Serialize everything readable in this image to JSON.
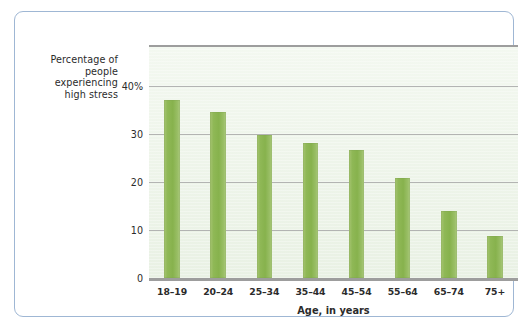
{
  "chart_data": {
    "type": "bar",
    "title": "",
    "xlabel": "Age, in years",
    "ylabel": "Percentage of people experiencing high stress",
    "categories": [
      "18–19",
      "20–24",
      "25–34",
      "35–44",
      "45–54",
      "55–64",
      "65–74",
      "75+"
    ],
    "values": [
      37.0,
      34.6,
      29.7,
      28.0,
      26.5,
      20.8,
      13.9,
      8.7
    ],
    "ylim": [
      0,
      48
    ],
    "yticks": [
      0,
      10,
      20,
      30,
      40
    ],
    "ytick_labels": [
      "0",
      "10",
      "20",
      "30",
      "40%"
    ],
    "grid": "horizontal",
    "legend": "none",
    "bar_color": "#8fb856",
    "plot_background": "#eef4ea",
    "axis_color": "#9d9d9d",
    "frame_color": "#9fb7d4"
  },
  "axis": {
    "y_title_lines": [
      "Percentage of",
      "people",
      "experiencing",
      "high stress"
    ],
    "x_title": "Age, in years"
  }
}
